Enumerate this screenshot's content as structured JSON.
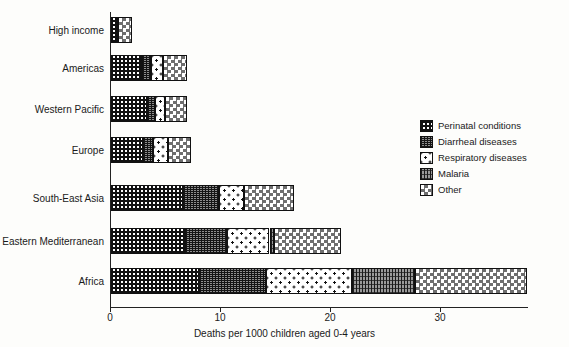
{
  "chart_data": {
    "type": "bar",
    "orientation": "horizontal",
    "stacked": true,
    "title": "",
    "xlabel": "Deaths per 1000 children aged 0-4 years",
    "ylabel": "",
    "xlim": [
      0,
      38
    ],
    "xticks": [
      0,
      10,
      20,
      30
    ],
    "xtick_labels": [
      "0",
      "10",
      "20",
      "30"
    ],
    "grid": false,
    "legend_position": "right",
    "categories": [
      "High income",
      "Americas",
      "Western Pacific",
      "Europe",
      "South-East Asia",
      "Eastern Mediterranean",
      "Africa"
    ],
    "series": [
      {
        "name": "Perinatal conditions",
        "pattern": "dense-square-grid",
        "values": [
          0.7,
          2.9,
          3.4,
          3.0,
          6.6,
          6.8,
          8.1
        ]
      },
      {
        "name": "Diarrheal diseases",
        "pattern": "fine-crosshatch",
        "values": [
          0.0,
          0.8,
          0.7,
          0.9,
          3.3,
          3.8,
          6.1
        ]
      },
      {
        "name": "Respiratory diseases",
        "pattern": "sparse-dots",
        "values": [
          0.0,
          1.1,
          0.9,
          1.4,
          2.3,
          3.9,
          7.8
        ]
      },
      {
        "name": "Malaria",
        "pattern": "vertical-lines",
        "values": [
          0.0,
          0.0,
          0.0,
          0.0,
          0.0,
          0.4,
          5.7
        ]
      },
      {
        "name": "Other",
        "pattern": "checkerboard",
        "values": [
          1.3,
          2.2,
          2.0,
          2.1,
          4.5,
          6.1,
          10.2
        ]
      }
    ],
    "totals": [
      2.0,
      7.0,
      7.0,
      7.4,
      16.7,
      21.0,
      37.9
    ]
  },
  "axis": {
    "x_title": "Deaths per 1000 children aged 0-4 years",
    "ticks": [
      {
        "label": "0",
        "value": 0
      },
      {
        "label": "10",
        "value": 10
      },
      {
        "label": "20",
        "value": 20
      },
      {
        "label": "30",
        "value": 30
      }
    ]
  },
  "categories": [
    {
      "label": "High income"
    },
    {
      "label": "Americas"
    },
    {
      "label": "Western Pacific"
    },
    {
      "label": "Europe"
    },
    {
      "label": "South-East Asia"
    },
    {
      "label": "Eastern Mediterranean"
    },
    {
      "label": "Africa"
    }
  ],
  "legend": {
    "items": [
      {
        "label": "Perinatal conditions",
        "icon": "pattern-dense-square-grid-icon"
      },
      {
        "label": "Diarrheal diseases",
        "icon": "pattern-fine-crosshatch-icon"
      },
      {
        "label": "Respiratory diseases",
        "icon": "pattern-sparse-dots-icon"
      },
      {
        "label": "Malaria",
        "icon": "pattern-vertical-lines-icon"
      },
      {
        "label": "Other",
        "icon": "pattern-checkerboard-icon"
      }
    ]
  },
  "colors": {
    "ink": "#1a1a1a",
    "axis": "#222222",
    "background": "#fdfdfb"
  }
}
